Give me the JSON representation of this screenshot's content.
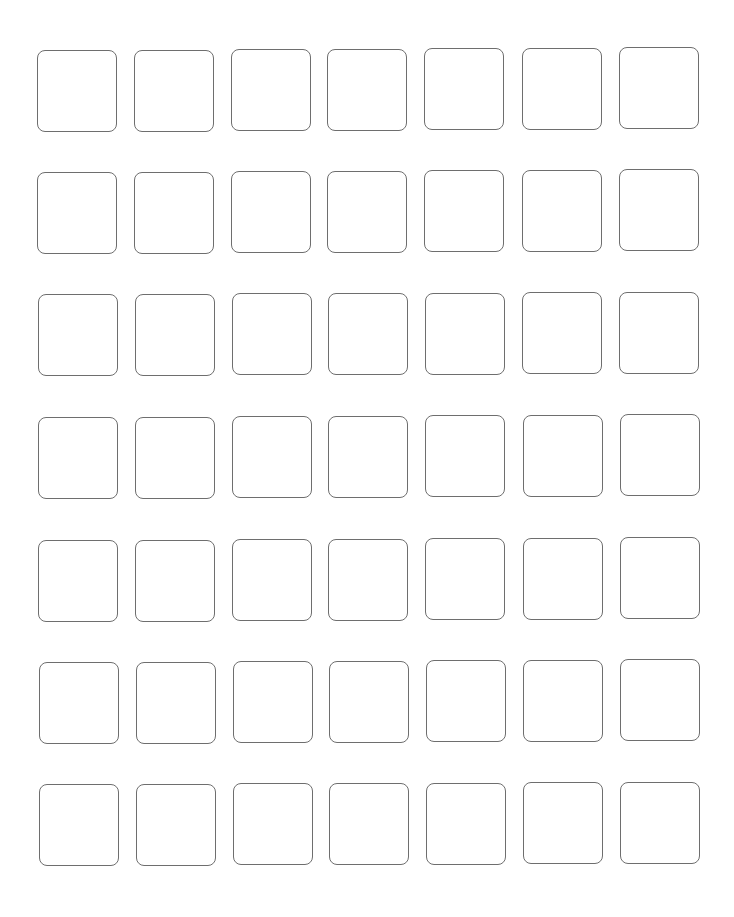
{
  "grid": {
    "rows": 7,
    "cols": 7,
    "cell_border_color": "#6e6e6e",
    "background_color": "#ffffff",
    "row_tops_left": [
      50,
      172,
      294,
      417,
      540,
      662,
      784
    ],
    "row_tops_right": [
      47,
      169,
      292,
      414,
      537,
      659,
      782
    ],
    "col_lefts_top": [
      37,
      134,
      231,
      327,
      424,
      522,
      619
    ],
    "col_lefts_bottom": [
      39,
      136,
      233,
      329,
      426,
      523,
      620
    ],
    "cells": "empty"
  }
}
